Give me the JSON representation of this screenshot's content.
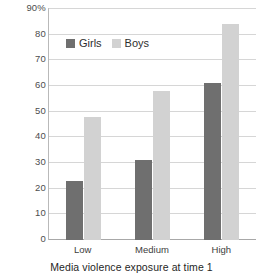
{
  "chart_data": {
    "type": "bar",
    "title": "",
    "subtitle": "",
    "xlabel": "Media violence exposure at time 1",
    "ylabel": "",
    "categories": [
      "Low",
      "Medium",
      "High"
    ],
    "series": [
      {
        "name": "Girls",
        "values": [
          23,
          31,
          61
        ],
        "color": "#6f6f6f"
      },
      {
        "name": "Boys",
        "values": [
          48,
          58,
          84
        ],
        "color": "#d2d2d2"
      }
    ],
    "ylim": [
      0,
      90
    ],
    "ytick_values": [
      0,
      10,
      20,
      30,
      40,
      50,
      60,
      70,
      80,
      90
    ],
    "ytick_labels": [
      "0",
      "10",
      "20",
      "30",
      "40",
      "50",
      "60",
      "70",
      "80",
      "90%"
    ],
    "grid": true,
    "legend_position": "top-left-inside",
    "orientation": "vertical",
    "grouping": "grouped"
  },
  "axes": {
    "y_axis_cut_label": "e s 2",
    "y_top_label": "90%"
  },
  "legend": {
    "items": [
      {
        "label": "Girls",
        "swatch": "girls"
      },
      {
        "label": "Boys",
        "swatch": "boys"
      }
    ]
  }
}
